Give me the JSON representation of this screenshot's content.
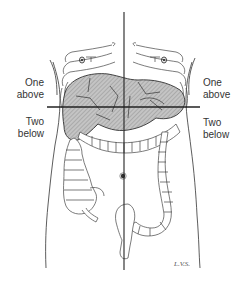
{
  "diagram": {
    "type": "anatomical-illustration",
    "labels": {
      "left_upper": {
        "line1": "One",
        "line2": "above"
      },
      "left_lower": {
        "line1": "Two",
        "line2": "below"
      },
      "right_upper": {
        "line1": "One",
        "line2": "above"
      },
      "right_lower": {
        "line1": "Two",
        "line2": "below"
      }
    },
    "signature": "L.V.S.",
    "reference_lines": {
      "vertical": {
        "x": 124,
        "y1": 12,
        "y2": 270
      },
      "horizontal": {
        "y": 107,
        "x1": 47,
        "x2": 200
      }
    },
    "colors": {
      "line": "#222222",
      "shaded_organ": "#b8b8b8",
      "hatch": "#8a8a8a",
      "outline": "#333333",
      "background": "#ffffff"
    }
  }
}
